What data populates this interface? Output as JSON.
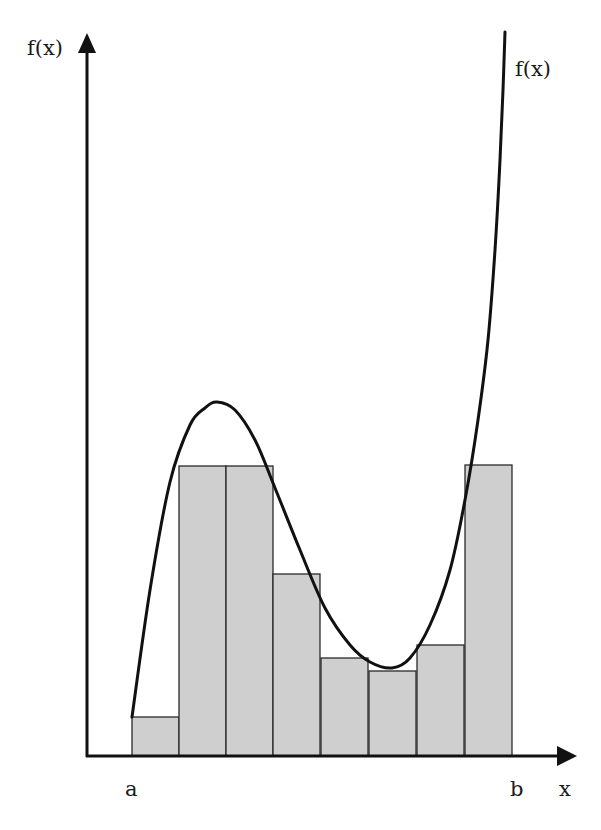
{
  "diagram": {
    "y_axis_label": "f(x)",
    "x_axis_label": "x",
    "curve_label": "f(x)",
    "interval_start_label": "a",
    "interval_end_label": "b",
    "num_rectangles": 8,
    "colors": {
      "bar_fill": "#cfcfcf",
      "stroke": "#111111",
      "background": "#ffffff"
    }
  },
  "chart_data": {
    "type": "bar",
    "categories": [
      "1",
      "2",
      "3",
      "4",
      "5",
      "6",
      "7",
      "8"
    ],
    "values": [
      39,
      290,
      290,
      182,
      98,
      85,
      111,
      291
    ],
    "pixel_geometry": {
      "x_axis_y": 756,
      "y_axis_x": 87,
      "bar_left_edges": [
        132,
        179,
        226,
        273,
        321,
        369,
        417,
        465
      ],
      "bar_width": 48,
      "bar_tops": [
        717,
        466,
        466,
        574,
        658,
        671,
        645,
        465
      ]
    },
    "curve_points": [
      [
        132,
        717
      ],
      [
        150,
        590
      ],
      [
        170,
        482
      ],
      [
        190,
        425
      ],
      [
        205,
        408
      ],
      [
        217,
        402
      ],
      [
        235,
        410
      ],
      [
        255,
        440
      ],
      [
        275,
        488
      ],
      [
        300,
        550
      ],
      [
        325,
        608
      ],
      [
        350,
        645
      ],
      [
        370,
        662
      ],
      [
        392,
        668
      ],
      [
        410,
        658
      ],
      [
        430,
        625
      ],
      [
        450,
        570
      ],
      [
        465,
        500
      ],
      [
        478,
        420
      ],
      [
        488,
        340
      ],
      [
        495,
        250
      ],
      [
        500,
        160
      ],
      [
        503,
        90
      ],
      [
        505,
        32
      ]
    ],
    "xlabel": "x",
    "ylabel": "f(x)",
    "x_ticks": [
      "a",
      "b"
    ],
    "grid": false,
    "legend": null
  }
}
